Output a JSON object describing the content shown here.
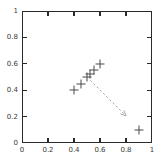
{
  "chart_data": {
    "type": "scatter",
    "title": "",
    "subtitle": "",
    "xlabel": "",
    "ylabel": "",
    "xlim": [
      0,
      1
    ],
    "ylim": [
      0,
      1
    ],
    "grid": false,
    "legend": null,
    "legend_position": "none",
    "marker": "plus",
    "marker_color": "#4a4a4a",
    "frame_color": "#2b2b2b",
    "background_color": "#ffffff",
    "x_ticks": [
      0,
      0.2,
      0.4,
      0.6,
      0.8,
      1
    ],
    "y_ticks": [
      0,
      0.2,
      0.4,
      0.6,
      0.8,
      1
    ],
    "x_tick_labels": [
      "0",
      "0.2",
      "0.4",
      "0.6",
      "0.8",
      "1"
    ],
    "y_tick_labels": [
      "0",
      "0.2",
      "0.4",
      "0.6",
      "0.8",
      "1"
    ],
    "series": [
      {
        "name": "points",
        "marker": "plus",
        "points": [
          {
            "x": 0.4,
            "y": 0.4
          },
          {
            "x": 0.45,
            "y": 0.45
          },
          {
            "x": 0.5,
            "y": 0.5
          },
          {
            "x": 0.525,
            "y": 0.525
          },
          {
            "x": 0.55,
            "y": 0.55
          },
          {
            "x": 0.6,
            "y": 0.6
          },
          {
            "x": 0.9,
            "y": 0.1
          }
        ]
      }
    ],
    "annotations": [
      {
        "type": "arrow",
        "label": "",
        "color": "#a8a8a8",
        "dashed": true,
        "start": {
          "x": 0.525,
          "y": 0.475
        },
        "end": {
          "x": 0.8,
          "y": 0.205
        }
      }
    ]
  }
}
